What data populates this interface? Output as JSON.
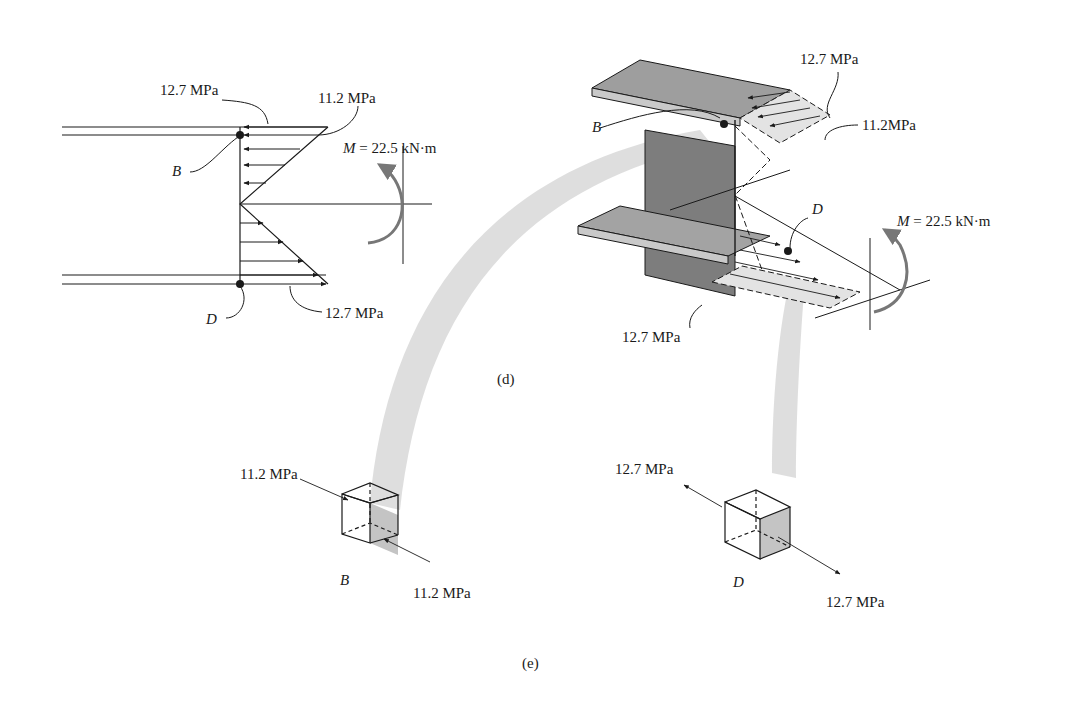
{
  "figure": {
    "captions": {
      "d": "(d)",
      "e": "(e)"
    },
    "panel_d_left": {
      "top_label": "12.7 MPa",
      "web_top_label": "11.2 MPa",
      "bottom_label": "12.7 MPa",
      "point_top": "B",
      "point_bottom": "D",
      "moment_symbol": "M",
      "moment_value": "= 22.5 kN·m"
    },
    "panel_d_right": {
      "top_label": "12.7 MPa",
      "web_top_label": "11.2MPa",
      "bottom_label": "12.7 MPa",
      "point_top": "B",
      "point_bottom": "D",
      "moment_symbol": "M",
      "moment_value": "= 22.5 kN·m"
    },
    "panel_e": {
      "element_B": {
        "point": "B",
        "stress_in": "11.2 MPa",
        "stress_out": "11.2 MPa",
        "state": "compression"
      },
      "element_D": {
        "point": "D",
        "stress_in": "12.7 MPa",
        "stress_out": "12.7 MPa",
        "state": "tension"
      }
    },
    "colors": {
      "line": "#1a1a1a",
      "shade": "#bdbdbd",
      "beam": "#9a9a9a",
      "web": "#7a7a7a",
      "ribbon": "#d6d6d6"
    }
  }
}
